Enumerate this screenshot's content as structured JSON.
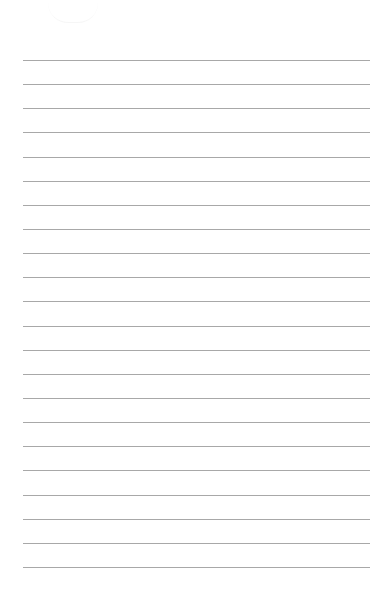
{
  "page": {
    "type": "lined-paper",
    "background": "#ffffff",
    "line_color": "#a8a8a8",
    "line_count": 22,
    "first_line_y": 60,
    "line_spacing": 24.14,
    "line_left": 23,
    "line_right": 370
  }
}
